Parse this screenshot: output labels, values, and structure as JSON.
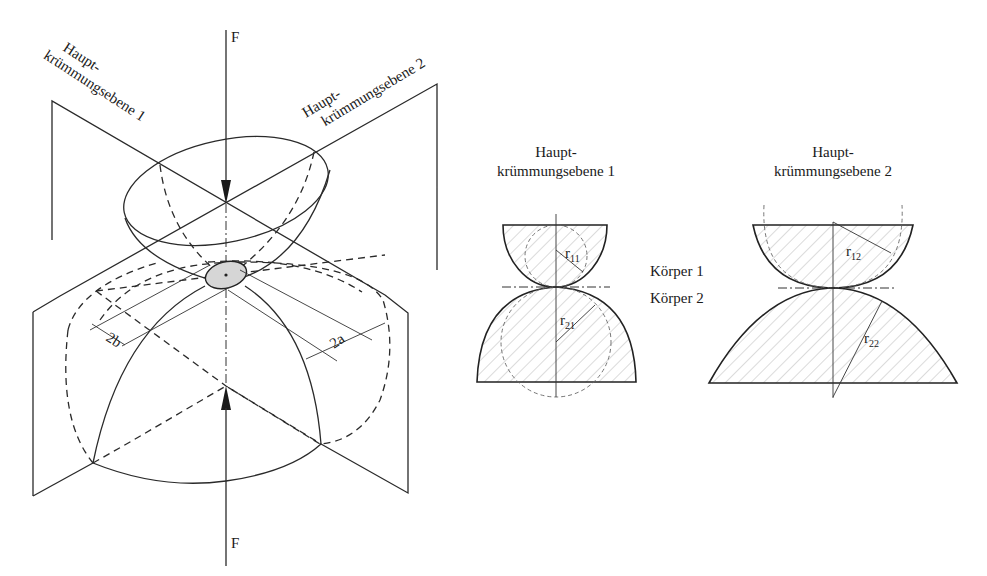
{
  "figure": {
    "colors": {
      "line": "#2a2a2a",
      "contact_fill": "#d6d6d6",
      "hatch": "#b8b8b8",
      "background": "#ffffff"
    }
  },
  "isometric_view": {
    "force_top": "F",
    "force_bottom": "F",
    "plane_1_label_line1": "Haupt-",
    "plane_1_label_line2": "krümmungsebene 1",
    "plane_2_label_line1": "Haupt-",
    "plane_2_label_line2": "krümmungsebene 2",
    "dim_minor_axis": "2b",
    "dim_major_axis": "2a"
  },
  "section_1": {
    "title_line1": "Haupt-",
    "title_line2": "krümmungsebene 1",
    "radius_upper": "r",
    "radius_upper_sub": "11",
    "radius_lower": "r",
    "radius_lower_sub": "21"
  },
  "section_2": {
    "title_line1": "Haupt-",
    "title_line2": "krümmungsebene 2",
    "radius_upper": "r",
    "radius_upper_sub": "12",
    "radius_lower": "r",
    "radius_lower_sub": "22"
  },
  "bodies": {
    "body_1": "Körper 1",
    "body_2": "Körper 2"
  }
}
